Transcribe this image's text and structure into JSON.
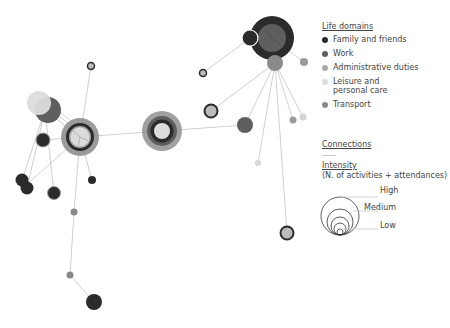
{
  "legend": {
    "title": "Life domains",
    "items": [
      {
        "label": "Family and friends",
        "color": "#2b2b2b"
      },
      {
        "label": "Work",
        "color": "#5e5e5e"
      },
      {
        "label": "Administrative duties",
        "color": "#a9a9a9"
      },
      {
        "label": "Leisure and personal care",
        "color": "#dcdcdc"
      },
      {
        "label": "Transport",
        "color": "#8a8a8a"
      }
    ]
  },
  "connections": {
    "title": "Connections",
    "intensity_title": "Intensity",
    "intensity_subtitle": "(N. of activities + attendances)",
    "high": "High",
    "medium": "Medium",
    "low": "Low"
  }
}
